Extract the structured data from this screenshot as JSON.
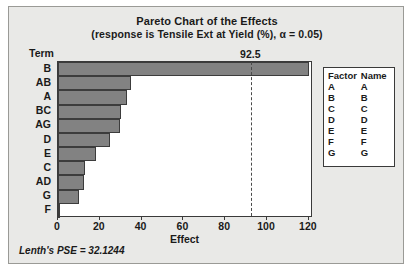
{
  "chart_data": {
    "type": "bar",
    "orientation": "horizontal",
    "title": "Pareto Chart of the Effects",
    "subtitle": "(response is Tensile Ext at Yield (%), α = 0.05)",
    "xlabel": "Effect",
    "ylabel": "Term",
    "categories": [
      "B",
      "AB",
      "A",
      "BC",
      "AG",
      "D",
      "E",
      "C",
      "AD",
      "G",
      "F"
    ],
    "values": [
      120.0,
      35.0,
      33.0,
      30.0,
      29.5,
      25.0,
      18.0,
      13.0,
      12.5,
      10.0,
      0.6
    ],
    "xlim": [
      0,
      122
    ],
    "xticks": [
      0,
      20,
      40,
      60,
      80,
      100,
      120
    ],
    "xtick_labels": [
      "0",
      "20",
      "40",
      "60",
      "80",
      "100",
      "120"
    ],
    "grid": false,
    "legend_position": "right",
    "reference_line": {
      "value": 92.5,
      "label": "92.5",
      "style": "dashed"
    },
    "annotations": {
      "footnote": "Lenth's PSE = 32.1244"
    },
    "colors": {
      "bar_fill": "#828282",
      "bar_edge": "#3c3c3c",
      "plot_background": "#ffffff",
      "figure_background": "#e9e9e7",
      "text": "#1a1a1a",
      "reference_line": "#4a4a4a"
    }
  },
  "legend": {
    "headers": [
      "Factor",
      "Name"
    ],
    "rows": [
      {
        "factor": "A",
        "name": "A"
      },
      {
        "factor": "B",
        "name": "B"
      },
      {
        "factor": "C",
        "name": "C"
      },
      {
        "factor": "D",
        "name": "D"
      },
      {
        "factor": "E",
        "name": "E"
      },
      {
        "factor": "F",
        "name": "F"
      },
      {
        "factor": "G",
        "name": "G"
      }
    ]
  }
}
